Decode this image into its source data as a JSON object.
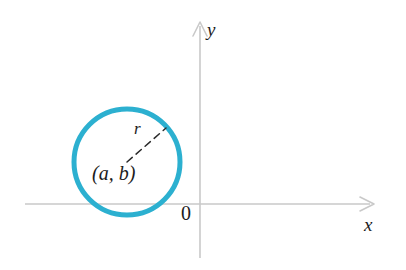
{
  "figure": {
    "type": "geometry-diagram",
    "background_color": "#ffffff",
    "axes": {
      "x_axis": {
        "label": "x",
        "line_color": "#c9c9c9",
        "start_x": 25,
        "end_x": 374,
        "y": 204,
        "arrow": "right"
      },
      "y_axis": {
        "label": "y",
        "line_color": "#c9c9c9",
        "x": 200,
        "start_y": 258,
        "end_y": 22,
        "arrow": "up"
      },
      "origin_label": "0"
    },
    "circle": {
      "center_label": "(a, b)",
      "center_x": 127,
      "center_y": 162,
      "radius": 53,
      "stroke_color": "#2cb0d0",
      "stroke_width": 5,
      "fill": "none"
    },
    "radius_line": {
      "label": "r",
      "style": "dashed",
      "stroke_color": "#2a2a2a",
      "from_x": 127,
      "from_y": 162,
      "to_x": 166,
      "to_y": 128
    }
  }
}
